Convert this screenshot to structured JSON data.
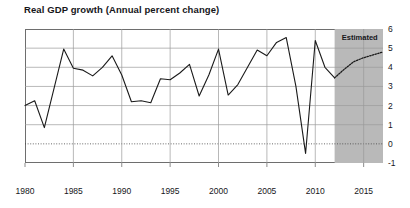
{
  "chart_data": {
    "type": "line",
    "title": "Real GDP growth (Annual percent change)",
    "xlabel": "",
    "ylabel": "",
    "xlim": [
      1980,
      2017
    ],
    "ylim": [
      -1,
      6
    ],
    "grid": true,
    "legend": null,
    "yticks": [
      "6",
      "5",
      "4",
      "3",
      "2",
      "1",
      "0",
      "-1"
    ],
    "ytick_values": [
      6,
      5,
      4,
      3,
      2,
      1,
      0,
      -1
    ],
    "xticks": [
      "1980",
      "1985",
      "1990",
      "1995",
      "2000",
      "2005",
      "2010",
      "2015"
    ],
    "xtick_values": [
      1980,
      1985,
      1990,
      1995,
      2000,
      2005,
      2010,
      2015
    ],
    "zero_line": 0,
    "annotations": [
      {
        "text": "Estimated",
        "x": 2014.6,
        "y": 5.6,
        "shaded_region": [
          2012,
          2017
        ],
        "shade_color": "#b9b9b9"
      }
    ],
    "series": [
      {
        "name": "Real GDP growth",
        "style": "solid",
        "color": "#1a1a1a",
        "x": [
          1980,
          1981,
          1982,
          1983,
          1984,
          1985,
          1986,
          1987,
          1988,
          1989,
          1990,
          1991,
          1992,
          1993,
          1994,
          1995,
          1996,
          1997,
          1998,
          1999,
          2000,
          2001,
          2002,
          2003,
          2004,
          2005,
          2006,
          2007,
          2008,
          2009,
          2010,
          2011,
          2012
        ],
        "values": [
          2.0,
          2.25,
          0.85,
          2.9,
          4.95,
          3.95,
          3.85,
          3.55,
          4.0,
          4.6,
          3.6,
          2.2,
          2.25,
          2.15,
          3.4,
          3.35,
          3.7,
          4.15,
          2.5,
          3.6,
          4.95,
          2.55,
          3.1,
          4.0,
          4.9,
          4.6,
          5.3,
          5.55,
          3.0,
          -0.5,
          5.4,
          4.0,
          3.45
        ]
      },
      {
        "name": "Estimated real GDP growth",
        "style": "dotted",
        "color": "#1a1a1a",
        "x": [
          2012,
          2013,
          2014,
          2015,
          2016,
          2017
        ],
        "values": [
          3.45,
          3.9,
          4.3,
          4.5,
          4.65,
          4.8
        ]
      }
    ]
  }
}
